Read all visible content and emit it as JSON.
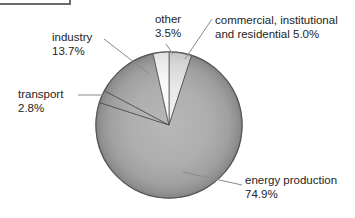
{
  "figure": {
    "cropped_border_note": "bottom-right corner of a figure frame cut off at top-left"
  },
  "chart_data": {
    "type": "pie",
    "title": "",
    "values_unit": "%",
    "start_angle_deg": 0,
    "direction": "clockwise",
    "legend_position": "external-callout-labels",
    "slices": [
      {
        "label": "commercial, institutional and residential",
        "value": 5.0,
        "fill": "light"
      },
      {
        "label": "energy production",
        "value": 74.9,
        "fill": "gray"
      },
      {
        "label": "transport",
        "value": 2.8,
        "fill": "gray"
      },
      {
        "label": "industry",
        "value": 13.7,
        "fill": "gray"
      },
      {
        "label": "other",
        "value": 3.5,
        "fill": "white"
      }
    ]
  },
  "callouts": {
    "other": {
      "line1": "other",
      "line2": "3.5%"
    },
    "commercial": {
      "line1": "commercial, institutional",
      "line2": "and residential 5.0%"
    },
    "industry": {
      "line1": "industry",
      "line2": "13.7%"
    },
    "transport": {
      "line1": "transport",
      "line2": "2.8%"
    },
    "energy": {
      "line1": "energy production",
      "line2": "74.9%"
    }
  },
  "colors": {
    "text": "#242424",
    "leader_line": "#8a8a8a",
    "wedge_outline": "#4d4d4d",
    "pie_rim": "#585858",
    "frame_corner": "#6a6a6a",
    "gray_center": "#b8b8b8",
    "gray_mid": "#aeaeae",
    "gray_rim": "#828282",
    "white_center": "#ffffff",
    "white_rim": "#dedede",
    "light_center": "#f2f2f2",
    "light_rim": "#c6c6c6"
  }
}
